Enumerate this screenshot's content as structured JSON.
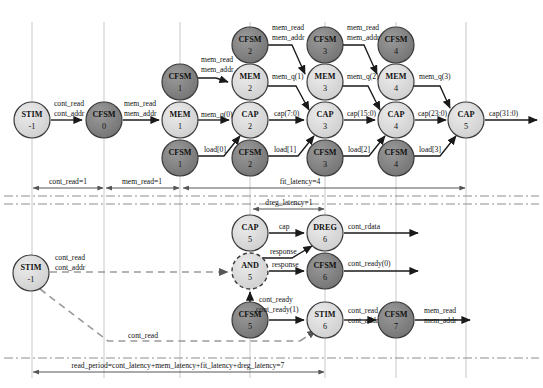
{
  "figure": {
    "title": "",
    "type": "timing-dependency-diagram",
    "width": 543,
    "height": 388
  },
  "colors": {
    "node_light": "#d4d4d4",
    "node_dark": "#808080",
    "node_stroke": "#3a3a3a",
    "gridline": "#c9c9c9",
    "arrow": "#1a1a1a",
    "dashed": "#9a9a9a",
    "text": "#111111"
  },
  "columns": [
    {
      "id": "c0",
      "x": 32
    },
    {
      "id": "c1",
      "x": 104
    },
    {
      "id": "c2",
      "x": 180
    },
    {
      "id": "c3",
      "x": 250
    },
    {
      "id": "c4",
      "x": 325
    },
    {
      "id": "c5",
      "x": 396
    },
    {
      "id": "c6",
      "x": 466
    }
  ],
  "nodes": [
    {
      "id": "stim_m1",
      "name": "STIM",
      "num": "-1",
      "x": 32,
      "y": 120,
      "r": 18,
      "shade": "light",
      "dashed": false
    },
    {
      "id": "cfsm_0",
      "name": "CFSM",
      "num": "0",
      "x": 104,
      "y": 120,
      "r": 18,
      "shade": "dark",
      "dashed": false
    },
    {
      "id": "mem_1",
      "name": "MEM",
      "num": "1",
      "x": 180,
      "y": 120,
      "r": 18,
      "shade": "light",
      "dashed": false
    },
    {
      "id": "cfsm_1t",
      "name": "CFSM",
      "num": "1",
      "x": 180,
      "y": 82,
      "r": 18,
      "shade": "dark",
      "dashed": false
    },
    {
      "id": "cfsm_1b",
      "name": "CFSM",
      "num": "1",
      "x": 180,
      "y": 158,
      "r": 18,
      "shade": "dark",
      "dashed": false
    },
    {
      "id": "cfsm_2t",
      "name": "CFSM",
      "num": "2",
      "x": 250,
      "y": 45,
      "r": 18,
      "shade": "dark",
      "dashed": false
    },
    {
      "id": "mem_2",
      "name": "MEM",
      "num": "2",
      "x": 250,
      "y": 82,
      "r": 18,
      "shade": "light",
      "dashed": false
    },
    {
      "id": "cap_2",
      "name": "CAP",
      "num": "2",
      "x": 250,
      "y": 120,
      "r": 18,
      "shade": "light",
      "dashed": false
    },
    {
      "id": "cfsm_2b",
      "name": "CFSM",
      "num": "2",
      "x": 250,
      "y": 158,
      "r": 18,
      "shade": "dark",
      "dashed": false
    },
    {
      "id": "cfsm_3t",
      "name": "CFSM",
      "num": "3",
      "x": 325,
      "y": 45,
      "r": 18,
      "shade": "dark",
      "dashed": false
    },
    {
      "id": "mem_3",
      "name": "MEM",
      "num": "3",
      "x": 325,
      "y": 82,
      "r": 18,
      "shade": "light",
      "dashed": false
    },
    {
      "id": "cap_3",
      "name": "CAP",
      "num": "3",
      "x": 325,
      "y": 120,
      "r": 18,
      "shade": "light",
      "dashed": false
    },
    {
      "id": "cfsm_3b",
      "name": "CFSM",
      "num": "3",
      "x": 325,
      "y": 158,
      "r": 18,
      "shade": "dark",
      "dashed": false
    },
    {
      "id": "cfsm_4t",
      "name": "CFSM",
      "num": "4",
      "x": 396,
      "y": 45,
      "r": 18,
      "shade": "dark",
      "dashed": false
    },
    {
      "id": "mem_4",
      "name": "MEM",
      "num": "4",
      "x": 396,
      "y": 82,
      "r": 18,
      "shade": "light",
      "dashed": false
    },
    {
      "id": "cap_4",
      "name": "CAP",
      "num": "4",
      "x": 396,
      "y": 120,
      "r": 18,
      "shade": "light",
      "dashed": false
    },
    {
      "id": "cfsm_4b",
      "name": "CFSM",
      "num": "4",
      "x": 396,
      "y": 158,
      "r": 18,
      "shade": "dark",
      "dashed": false
    },
    {
      "id": "cap_5t",
      "name": "CAP",
      "num": "5",
      "x": 466,
      "y": 120,
      "r": 18,
      "shade": "light",
      "dashed": false
    },
    {
      "id": "cap_5l",
      "name": "CAP",
      "num": "5",
      "x": 250,
      "y": 233,
      "r": 18,
      "shade": "light",
      "dashed": false
    },
    {
      "id": "dreg_6",
      "name": "DREG",
      "num": "6",
      "x": 325,
      "y": 233,
      "r": 18,
      "shade": "light",
      "dashed": false
    },
    {
      "id": "and_5",
      "name": "AND",
      "num": "5",
      "x": 250,
      "y": 271,
      "r": 18,
      "shade": "light",
      "dashed": true
    },
    {
      "id": "cfsm_6",
      "name": "CFSM",
      "num": "6",
      "x": 325,
      "y": 271,
      "r": 18,
      "shade": "dark",
      "dashed": false
    },
    {
      "id": "stim_m1b",
      "name": "STIM",
      "num": "-1",
      "x": 31,
      "y": 273,
      "r": 18,
      "shade": "light",
      "dashed": false
    },
    {
      "id": "cfsm_5",
      "name": "CFSM",
      "num": "5",
      "x": 250,
      "y": 320,
      "r": 18,
      "shade": "dark",
      "dashed": false
    },
    {
      "id": "stim_6",
      "name": "STIM",
      "num": "6",
      "x": 325,
      "y": 320,
      "r": 18,
      "shade": "light",
      "dashed": false
    },
    {
      "id": "cfsm_7",
      "name": "CFSM",
      "num": "7",
      "x": 396,
      "y": 320,
      "r": 18,
      "shade": "dark",
      "dashed": false
    }
  ],
  "edges": [
    {
      "id": "e1",
      "from": "stim_m1",
      "to": "cfsm_0",
      "label": [
        "cont_read",
        "cont_addr"
      ]
    },
    {
      "id": "e2",
      "from": "cfsm_0",
      "to": "mem_1",
      "label": [
        "mem_read",
        "mem_addr"
      ]
    },
    {
      "id": "e3",
      "from": "cfsm_1t",
      "to": "mem_2",
      "label": [
        "mem_read",
        "mem_addr"
      ]
    },
    {
      "id": "e4",
      "from": "mem_1",
      "to": "cap_2",
      "label": [
        "mem_q(0)"
      ]
    },
    {
      "id": "e5",
      "from": "cfsm_1b",
      "to": "cap_2",
      "label": [
        "load[0]"
      ]
    },
    {
      "id": "e6",
      "from": "cfsm_2t",
      "to": "mem_3",
      "label": [
        "mem_read",
        "mem_addr"
      ]
    },
    {
      "id": "e7",
      "from": "mem_2",
      "to": "cap_3",
      "label": [
        "mem_q(1)"
      ]
    },
    {
      "id": "e8",
      "from": "cap_2",
      "to": "cap_3",
      "label": [
        "cap(7:0)"
      ]
    },
    {
      "id": "e9",
      "from": "cfsm_2b",
      "to": "cap_3",
      "label": [
        "load[1]"
      ]
    },
    {
      "id": "e10",
      "from": "cfsm_3t",
      "to": "mem_4",
      "label": [
        "mem_read",
        "mem_addr"
      ]
    },
    {
      "id": "e11",
      "from": "mem_3",
      "to": "cap_4",
      "label": [
        "mem_q(2)"
      ]
    },
    {
      "id": "e12",
      "from": "cap_3",
      "to": "cap_4",
      "label": [
        "cap(15:0)"
      ]
    },
    {
      "id": "e13",
      "from": "cfsm_3b",
      "to": "cap_4",
      "label": [
        "load[2]"
      ]
    },
    {
      "id": "e14",
      "from": "mem_4",
      "to": "cap_5t",
      "label": [
        "mem_q(3)"
      ]
    },
    {
      "id": "e15",
      "from": "cap_4",
      "to": "cap_5t",
      "label": [
        "cap(23:0)"
      ]
    },
    {
      "id": "e16",
      "from": "cfsm_4b",
      "to": "cap_5t",
      "label": [
        "load[3]"
      ]
    },
    {
      "id": "e17",
      "from": "cap_5t",
      "to": "out",
      "label": [
        "cap(31:0)"
      ]
    },
    {
      "id": "e18",
      "from": "cap_5l",
      "to": "dreg_6",
      "label": [
        "cap"
      ]
    },
    {
      "id": "e19",
      "from": "and_5",
      "to": "dreg_6",
      "label": [
        "response"
      ]
    },
    {
      "id": "e20",
      "from": "and_5",
      "to": "cfsm_6",
      "label": [
        "response"
      ]
    },
    {
      "id": "e21",
      "from": "dreg_6",
      "to": "out",
      "label": [
        "cont_rdata"
      ]
    },
    {
      "id": "e22",
      "from": "cfsm_6",
      "to": "out",
      "label": [
        "cont_ready(0)"
      ]
    },
    {
      "id": "e23",
      "from": "cfsm_5",
      "to": "stim_6",
      "label": [
        "cont_ready",
        "cont_ready(1)"
      ]
    },
    {
      "id": "e24",
      "from": "stim_6",
      "to": "cfsm_7",
      "label": [
        "cont_read",
        "cont_addr"
      ]
    },
    {
      "id": "e25",
      "from": "cfsm_7",
      "to": "out",
      "label": [
        "mem_read",
        "mem_addr"
      ]
    },
    {
      "id": "e26",
      "from": "stim_m1b",
      "to": "and_5",
      "label": [
        "cont_read",
        "cont_addr"
      ],
      "style": "dashed"
    },
    {
      "id": "e27",
      "from": "stim_m1b",
      "to": "stim_6",
      "label": [
        "cont_read"
      ],
      "style": "dashed"
    }
  ],
  "timelines": [
    {
      "id": "t_cont_read",
      "label": "cont_read=1",
      "x1": 32,
      "x2": 104,
      "y": 185
    },
    {
      "id": "t_mem_read",
      "label": "mem_read=1",
      "x1": 106,
      "x2": 180,
      "y": 185
    },
    {
      "id": "t_fit",
      "label": "fit_latency=4",
      "x1": 182,
      "x2": 466,
      "y": 185
    },
    {
      "id": "t_dreg",
      "label": "dreg_latency=1",
      "x1": 252,
      "x2": 325,
      "y": 212
    },
    {
      "id": "t_read_period",
      "label": "read_period=cont_latency+mem_latency+fit_latency+dreg_latency=7",
      "x1": 32,
      "x2": 325,
      "y": 372
    }
  ],
  "separators": [
    {
      "id": "sep1",
      "y": 196,
      "style": "dash-dot"
    },
    {
      "id": "sep2",
      "y": 204,
      "style": "dash-dot"
    },
    {
      "id": "sep3",
      "y": 358,
      "style": "dash-dot"
    }
  ]
}
